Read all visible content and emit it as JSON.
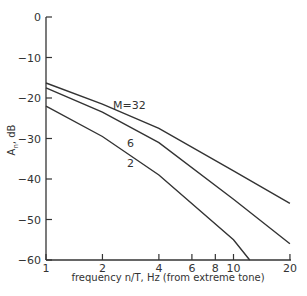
{
  "chart_data": {
    "type": "line",
    "title": "",
    "xlabel": "frequency n/T, Hz (from extreme tone)",
    "ylabel": "A_n, dB",
    "xscale": "log",
    "xlim": [
      1,
      20
    ],
    "ylim": [
      -60,
      0
    ],
    "xticks": [
      1,
      2,
      4,
      6,
      8,
      10,
      20
    ],
    "yticks": [
      0,
      -10,
      -20,
      -30,
      -40,
      -50,
      -60
    ],
    "grid": false,
    "series": [
      {
        "name": "M=32",
        "x": [
          1,
          2,
          4,
          10,
          20
        ],
        "y": [
          -16.3,
          -21.5,
          -27.5,
          -38,
          -46
        ]
      },
      {
        "name": "6",
        "x": [
          1,
          2,
          4,
          10,
          20
        ],
        "y": [
          -17.5,
          -23.5,
          -31,
          -45,
          -56
        ]
      },
      {
        "name": "2",
        "x": [
          1,
          2,
          4,
          10,
          12.2
        ],
        "y": [
          -22,
          -29.5,
          -39,
          -55,
          -60
        ]
      }
    ],
    "annotations": [
      "M=32",
      "6",
      "2"
    ]
  },
  "labels": {
    "xlabel": "frequency n/T, Hz (from extreme tone)",
    "ylabel_main": "A",
    "ylabel_sub": "n",
    "ylabel_unit": ", dB",
    "curve_labels": [
      "M=32",
      "6",
      "2"
    ]
  }
}
